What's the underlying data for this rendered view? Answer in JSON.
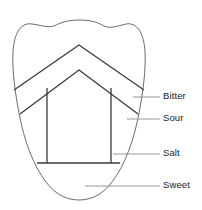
{
  "diagram": {
    "stroke_color": "#3a3a3a",
    "outline_color": "#5a5a5a",
    "leader_color": "#8a8a8a",
    "background_color": "#ffffff",
    "text_color": "#1a1a1a"
  },
  "labels": [
    {
      "id": "bitter",
      "text": "Bitter",
      "region": "back-of-tongue"
    },
    {
      "id": "sour",
      "text": "Sour",
      "region": "upper-sides"
    },
    {
      "id": "salt",
      "text": "Salt",
      "region": "lower-sides"
    },
    {
      "id": "sweet",
      "text": "Sweet",
      "region": "tip-of-tongue"
    }
  ]
}
